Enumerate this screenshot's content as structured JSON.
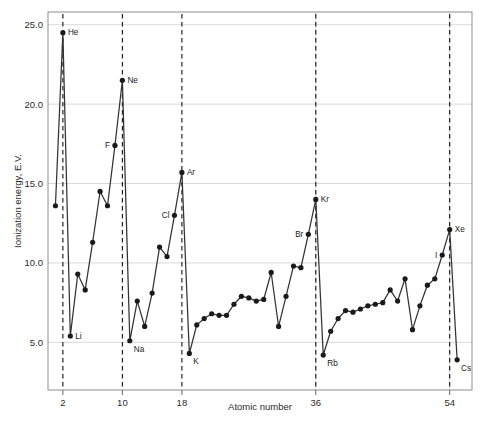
{
  "chart_data": {
    "type": "line",
    "title": "",
    "xlabel": "Atomic number",
    "ylabel": "Ionization energy, E.V.",
    "xlim": [
      0,
      57
    ],
    "ylim": [
      2.0,
      25.8
    ],
    "grid": true,
    "legend": "none",
    "y_ticks": [
      "5.0",
      "10.0",
      "15.0",
      "20.0",
      "25.0"
    ],
    "y_tick_values": [
      5.0,
      10.0,
      15.0,
      20.0,
      25.0
    ],
    "x_ticks": [
      "2",
      "10",
      "18",
      "36",
      "54"
    ],
    "x_tick_values": [
      2,
      10,
      18,
      36,
      54
    ],
    "vertical_markers": [
      2,
      10,
      18,
      36,
      54
    ],
    "x": [
      1,
      2,
      3,
      4,
      5,
      6,
      7,
      8,
      9,
      10,
      11,
      12,
      13,
      14,
      15,
      16,
      17,
      18,
      19,
      20,
      21,
      22,
      23,
      24,
      25,
      26,
      27,
      28,
      29,
      30,
      31,
      32,
      33,
      34,
      35,
      36,
      37,
      38,
      39,
      40,
      41,
      42,
      43,
      44,
      45,
      46,
      47,
      48,
      49,
      50,
      51,
      52,
      53,
      54,
      55
    ],
    "values": [
      13.6,
      24.5,
      5.4,
      9.3,
      8.3,
      11.3,
      14.5,
      13.6,
      17.4,
      21.5,
      5.1,
      7.6,
      6.0,
      8.1,
      11.0,
      10.4,
      13.0,
      15.7,
      4.3,
      6.1,
      6.5,
      6.8,
      6.7,
      6.7,
      7.4,
      7.9,
      7.8,
      7.6,
      7.7,
      9.4,
      6.0,
      7.9,
      9.8,
      9.7,
      11.8,
      14.0,
      4.2,
      5.7,
      6.5,
      7.0,
      6.9,
      7.1,
      7.3,
      7.4,
      7.5,
      8.3,
      7.6,
      9.0,
      5.8,
      7.3,
      8.6,
      9.0,
      10.5,
      12.1,
      3.9
    ],
    "points": [
      {
        "z": 1,
        "label": "",
        "value": 13.6
      },
      {
        "z": 2,
        "label": "He",
        "value": 24.5,
        "label_side": "right"
      },
      {
        "z": 3,
        "label": "Li",
        "value": 5.4,
        "label_side": "right"
      },
      {
        "z": 9,
        "label": "F",
        "value": 17.4,
        "label_side": "left"
      },
      {
        "z": 10,
        "label": "Ne",
        "value": 21.5,
        "label_side": "right"
      },
      {
        "z": 11,
        "label": "Na",
        "value": 5.1,
        "label_side": "below-right"
      },
      {
        "z": 17,
        "label": "Cl",
        "value": 13.0,
        "label_side": "left"
      },
      {
        "z": 18,
        "label": "Ar",
        "value": 15.7,
        "label_side": "right"
      },
      {
        "z": 19,
        "label": "K",
        "value": 4.3,
        "label_side": "below-right"
      },
      {
        "z": 35,
        "label": "Br",
        "value": 11.8,
        "label_side": "left"
      },
      {
        "z": 36,
        "label": "Kr",
        "value": 14.0,
        "label_side": "right"
      },
      {
        "z": 37,
        "label": "Rb",
        "value": 4.2,
        "label_side": "below-right"
      },
      {
        "z": 53,
        "label": "I",
        "value": 10.5,
        "label_side": "left"
      },
      {
        "z": 54,
        "label": "Xe",
        "value": 12.1,
        "label_side": "right"
      },
      {
        "z": 55,
        "label": "Cs",
        "value": 3.9,
        "label_side": "below-right"
      }
    ],
    "colors": {
      "line": "#333333",
      "marker": "#1a1a1a",
      "grid": "#c9c9c9",
      "frame": "#8d8d8d",
      "dashed_marker": "#111111",
      "background": "#ffffff"
    }
  }
}
